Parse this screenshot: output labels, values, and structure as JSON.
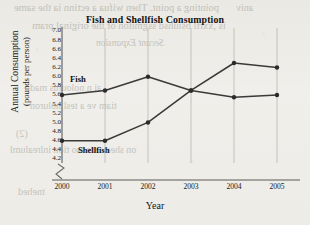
{
  "chart_data": {
    "type": "line",
    "title": "Fish and Shellfish Consumption",
    "xlabel": "Year",
    "ylabel_line1": "Annual Consumption",
    "ylabel_line2": "(pounds per person)",
    "categories": [
      "2000",
      "2001",
      "2002",
      "2003",
      "2004",
      "2005"
    ],
    "x": [
      2000,
      2001,
      2002,
      2003,
      2004,
      2005
    ],
    "series": [
      {
        "name": "Fish",
        "values": [
          5.6,
          5.7,
          6.0,
          5.7,
          5.55,
          5.6
        ]
      },
      {
        "name": "Shellfish",
        "values": [
          4.6,
          4.6,
          5.0,
          5.7,
          6.3,
          6.2
        ]
      }
    ],
    "ylim": [
      4.2,
      7.0
    ],
    "ytick_step": 0.2,
    "yticks": [
      "7.0",
      "6.8",
      "6.6",
      "6.4",
      "6.2",
      "6.0",
      "5.8",
      "5.6",
      "5.4",
      "5.2",
      "5.0",
      "4.8",
      "4.6",
      "4.4",
      "4.2"
    ],
    "xlim": [
      2000,
      2005
    ],
    "grid": "vertical-only",
    "axis_break": true,
    "legend_position": "inline-labels",
    "line_color": "#3a3a3a",
    "marker_color": "#2b2b2b"
  },
  "background_showthrough": {
    "line1": "pointing a point. Then wifua a ectinn ia the same",
    "line2": "is ,xxrtl bsiuhsd ssgmiton of the original pram",
    "line3": "Secant Expansion",
    "line4": "ai n noloulus mad",
    "line5": "tiam ve a tesl noluron",
    "line6": "(2)",
    "line7": "on sheev are tao tion inlrealuml",
    "line8": "tnehed",
    "line9": "aniv"
  }
}
